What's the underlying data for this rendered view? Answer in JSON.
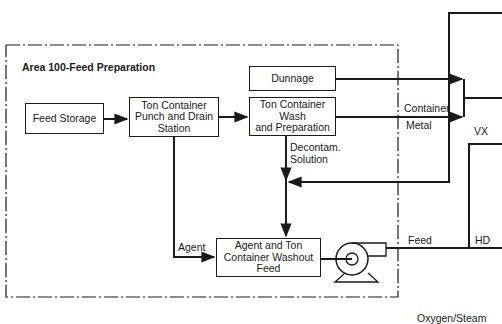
{
  "area": {
    "title": "Area 100-Feed Preparation"
  },
  "boxes": {
    "feed_storage": "Feed Storage",
    "punch_drain": [
      "Ton Container",
      "Punch and Drain",
      "Station"
    ],
    "dunnage": "Dunnage",
    "wash_prep": [
      "Ton Container",
      "Wash",
      "and Preparation"
    ],
    "washout_feed": [
      "Agent and Ton",
      "Container Washout",
      "Feed"
    ]
  },
  "labels": {
    "container": "Container",
    "metal": "Metal",
    "vx": "VX",
    "decontam": [
      "Decontam.",
      "Solution"
    ],
    "agent": "Agent",
    "feed": "Feed",
    "hd": "HD",
    "oxygen_steam": "Oxygen/Steam"
  },
  "colors": {
    "line": "#1a1a1a",
    "background": "#ffffff"
  }
}
